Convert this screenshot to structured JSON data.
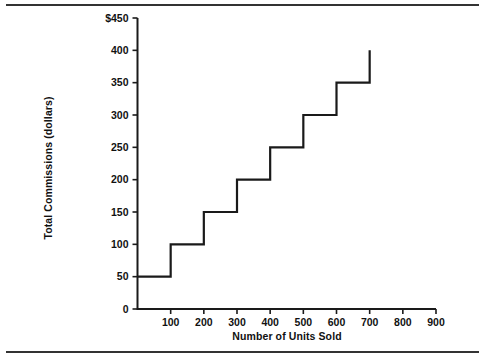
{
  "figure": {
    "clipped_title": "",
    "rules": [
      "top-rule",
      "bottom-rule"
    ],
    "line_color": "#1a1a1a",
    "background_color": "#ffffff"
  },
  "chart_data": {
    "type": "line",
    "subtype": "step",
    "title": "",
    "xlabel": "Number of Units Sold",
    "ylabel": "Total Commissions (dollars)",
    "xlim": [
      0,
      900
    ],
    "ylim": [
      0,
      450
    ],
    "grid": false,
    "legend": null,
    "x_ticks": [
      0,
      100,
      200,
      300,
      400,
      500,
      600,
      700,
      800,
      900
    ],
    "x_tick_labels": [
      "",
      "100",
      "200",
      "300",
      "400",
      "500",
      "600",
      "700",
      "800",
      "900"
    ],
    "y_ticks": [
      0,
      50,
      100,
      150,
      200,
      250,
      300,
      350,
      400,
      450
    ],
    "y_tick_labels": [
      "0",
      "50",
      "100",
      "150",
      "200",
      "250",
      "300",
      "350",
      "400",
      "$450"
    ],
    "steps": [
      {
        "x_start": 0,
        "x_end": 100,
        "y": 50
      },
      {
        "x_start": 100,
        "x_end": 200,
        "y": 100
      },
      {
        "x_start": 200,
        "x_end": 300,
        "y": 150
      },
      {
        "x_start": 300,
        "x_end": 400,
        "y": 200
      },
      {
        "x_start": 400,
        "x_end": 500,
        "y": 250
      },
      {
        "x_start": 500,
        "x_end": 600,
        "y": 300
      },
      {
        "x_start": 600,
        "x_end": 700,
        "y": 350
      },
      {
        "x_start": 700,
        "x_end": 700,
        "y": 400
      }
    ],
    "x": [
      0,
      100,
      100,
      200,
      200,
      300,
      300,
      400,
      400,
      500,
      500,
      600,
      600,
      700,
      700
    ],
    "y": [
      50,
      50,
      100,
      100,
      150,
      150,
      200,
      200,
      250,
      250,
      300,
      300,
      350,
      350,
      400
    ]
  }
}
